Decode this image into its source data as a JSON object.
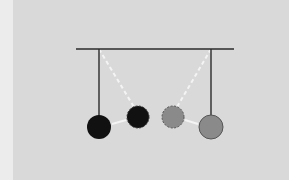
{
  "diagram": {
    "type": "pendulum-collision",
    "colors": {
      "background": "#d9d9d9",
      "edge_strip": "#ececec",
      "frame": "#2a2a2a",
      "dark_ball": "#111111",
      "light_ball": "#8a8a8a",
      "motion_path": "#f4f4f4"
    },
    "bar": {
      "x1": 76,
      "x2": 234,
      "y": 49
    },
    "pendulums": [
      {
        "name": "left",
        "pivot_x": 99,
        "ball": {
          "cx": 99,
          "cy": 127,
          "r": 12
        },
        "color": "dark"
      },
      {
        "name": "right",
        "pivot_x": 211,
        "ball": {
          "cx": 211,
          "cy": 127,
          "r": 12
        },
        "color": "light"
      }
    ],
    "ghost_positions": [
      {
        "name": "left-swung",
        "cx": 138,
        "cy": 117,
        "r": 11,
        "color": "dark",
        "dashed": true
      },
      {
        "name": "right-swung",
        "cx": 173,
        "cy": 117,
        "r": 11,
        "color": "light",
        "dashed": true
      }
    ]
  }
}
